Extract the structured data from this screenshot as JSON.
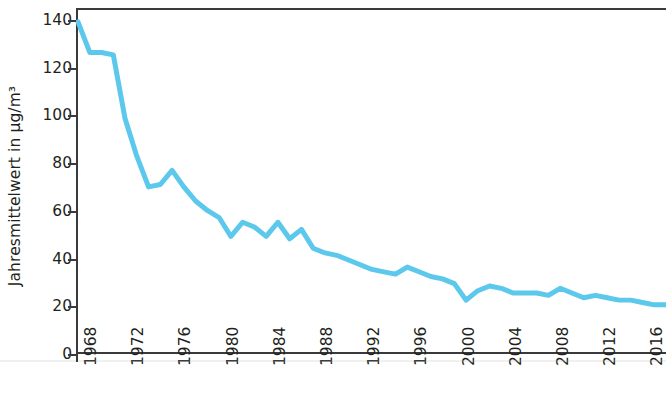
{
  "chart_data": {
    "type": "line",
    "title": "",
    "subtitle": "",
    "xlabel": "",
    "ylabel": "Jahresmittelwert in µg/m³",
    "xlim": [
      1968,
      2018
    ],
    "ylim": [
      0,
      145
    ],
    "grid": false,
    "legend_position": "none",
    "line_color": "#5BC8EC",
    "axis_color": "#3a3a3c",
    "text_color": "#231f20",
    "y_ticks": [
      0,
      20,
      40,
      60,
      80,
      100,
      120,
      140
    ],
    "y_tick_labels": [
      "0",
      "20",
      "40",
      "60",
      "80",
      "100",
      "120",
      "140"
    ],
    "x_ticks": [
      1968,
      1972,
      1976,
      1980,
      1984,
      1988,
      1992,
      1996,
      2000,
      2004,
      2008,
      2012,
      2016
    ],
    "x_tick_labels": [
      "1968",
      "1972",
      "1976",
      "1980",
      "1984",
      "1988",
      "1992",
      "1996",
      "2000",
      "2004",
      "2008",
      "2012",
      "2016"
    ],
    "series": [
      {
        "name": "Jahresmittelwert",
        "color": "#5BC8EC",
        "x": [
          1968,
          1969,
          1970,
          1971,
          1972,
          1973,
          1974,
          1975,
          1976,
          1977,
          1978,
          1979,
          1980,
          1981,
          1982,
          1983,
          1984,
          1985,
          1986,
          1987,
          1988,
          1989,
          1990,
          1991,
          1992,
          1993,
          1994,
          1995,
          1996,
          1997,
          1998,
          1999,
          2000,
          2001,
          2002,
          2003,
          2004,
          2005,
          2006,
          2007,
          2008,
          2009,
          2010,
          2011,
          2012,
          2013,
          2014,
          2015,
          2016,
          2017,
          2018
        ],
        "values": [
          140,
          127,
          127,
          126,
          99,
          83,
          70,
          71,
          77,
          70,
          64,
          60,
          57,
          49,
          55,
          53,
          49,
          55,
          48,
          52,
          44,
          42,
          41,
          39,
          37,
          35,
          34,
          33,
          36,
          34,
          32,
          31,
          29,
          22,
          26,
          28,
          27,
          25,
          25,
          25,
          24,
          27,
          25,
          23,
          24,
          23,
          22,
          22,
          21,
          20,
          20
        ]
      }
    ]
  },
  "axes": {
    "ylabel": "Jahresmittelwert in µg/m³"
  }
}
